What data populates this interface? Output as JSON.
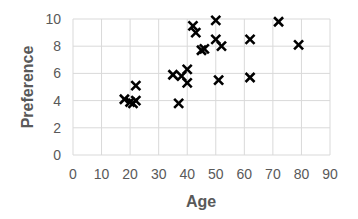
{
  "chart_data": {
    "type": "scatter",
    "title": "",
    "xlabel": "Age",
    "ylabel": "Preference",
    "xlim": [
      0,
      90
    ],
    "ylim": [
      0,
      10
    ],
    "x_ticks": [
      0,
      10,
      20,
      30,
      40,
      50,
      60,
      70,
      80,
      90
    ],
    "y_ticks": [
      0,
      2,
      4,
      6,
      8,
      10
    ],
    "grid": true,
    "legend": null,
    "marker": "x",
    "marker_color": "#000000",
    "series": [
      {
        "name": "Preference vs Age",
        "points": [
          {
            "x": 18,
            "y": 4.1
          },
          {
            "x": 20,
            "y": 3.9
          },
          {
            "x": 21,
            "y": 3.8
          },
          {
            "x": 22,
            "y": 4.0
          },
          {
            "x": 22,
            "y": 5.1
          },
          {
            "x": 35,
            "y": 5.9
          },
          {
            "x": 37,
            "y": 3.8
          },
          {
            "x": 38,
            "y": 5.8
          },
          {
            "x": 40,
            "y": 5.3
          },
          {
            "x": 40,
            "y": 6.3
          },
          {
            "x": 42,
            "y": 9.5
          },
          {
            "x": 43,
            "y": 9.0
          },
          {
            "x": 45,
            "y": 7.7
          },
          {
            "x": 46,
            "y": 7.8
          },
          {
            "x": 50,
            "y": 9.9
          },
          {
            "x": 50,
            "y": 8.5
          },
          {
            "x": 51,
            "y": 5.5
          },
          {
            "x": 52,
            "y": 8.0
          },
          {
            "x": 62,
            "y": 8.5
          },
          {
            "x": 62,
            "y": 5.7
          },
          {
            "x": 72,
            "y": 9.8
          },
          {
            "x": 79,
            "y": 8.1
          }
        ]
      }
    ]
  },
  "colors": {
    "gridline": "#d9d9d9",
    "tick_text": "#595959",
    "marker": "#000000"
  }
}
